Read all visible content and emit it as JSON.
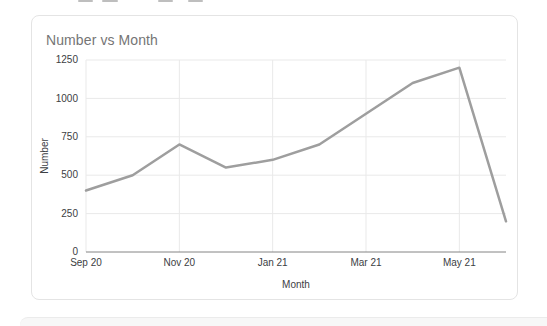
{
  "card": {
    "title": "Number vs Month"
  },
  "chart_data": {
    "type": "line",
    "title": "Number vs Month",
    "xlabel": "Month",
    "ylabel": "Number",
    "categories": [
      "Sep 20",
      "Oct 20",
      "Nov 20",
      "Dec 20",
      "Jan 21",
      "Feb 21",
      "Mar 21",
      "Apr 21",
      "May 21",
      "Jun 21"
    ],
    "values": [
      400,
      500,
      700,
      550,
      600,
      700,
      900,
      1100,
      1200,
      200
    ],
    "x_tick_labels": [
      "Sep 20",
      "Nov 20",
      "Jan 21",
      "Mar 21",
      "May 21"
    ],
    "x_tick_every": 2,
    "y_ticks": [
      0,
      250,
      500,
      750,
      1000,
      1250
    ],
    "ylim": [
      0,
      1250
    ],
    "grid": true,
    "legend": "none",
    "colors": {
      "line": "#9e9e9e",
      "axis": "#848484",
      "grid": "#e9e9e9",
      "tick_label": "#3c4043",
      "axis_title": "#3c4043",
      "title": "#757575",
      "card_border": "#e4e4e4",
      "background": "#ffffff"
    }
  }
}
